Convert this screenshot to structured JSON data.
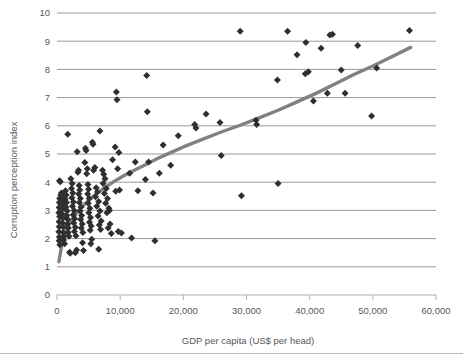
{
  "chart_data": {
    "type": "scatter",
    "title": "",
    "xlabel": "GDP per capita (US$ per head)",
    "ylabel": "Corruption perception index",
    "xlim": [
      0,
      60000
    ],
    "ylim": [
      0,
      10
    ],
    "xticks": [
      0,
      10000,
      20000,
      30000,
      40000,
      50000,
      60000
    ],
    "xtick_labels": [
      "0",
      "10,000",
      "20,000",
      "30,000",
      "40,000",
      "50,000",
      "60,000"
    ],
    "yticks": [
      0,
      1,
      2,
      3,
      4,
      5,
      6,
      7,
      8,
      9,
      10
    ],
    "ytick_labels": [
      "0",
      "1",
      "2",
      "3",
      "4",
      "5",
      "6",
      "7",
      "8",
      "9",
      "10"
    ],
    "grid": "horizontal",
    "legend": "none",
    "marker_shape": "diamond",
    "marker_color": "#2f2f31",
    "trendline": {
      "type": "logarithmic",
      "color": "#818183",
      "points": [
        [
          300,
          1.18
        ],
        [
          700,
          1.7
        ],
        [
          1200,
          2.12
        ],
        [
          1800,
          2.45
        ],
        [
          2500,
          2.72
        ],
        [
          3300,
          2.96
        ],
        [
          4200,
          3.18
        ],
        [
          5200,
          3.4
        ],
        [
          6300,
          3.6
        ],
        [
          7500,
          3.8
        ],
        [
          9000,
          4.02
        ],
        [
          10500,
          4.22
        ],
        [
          12000,
          4.4
        ],
        [
          14000,
          4.62
        ],
        [
          16000,
          4.85
        ],
        [
          18000,
          5.05
        ],
        [
          20000,
          5.25
        ],
        [
          23000,
          5.52
        ],
        [
          26000,
          5.78
        ],
        [
          29000,
          6.02
        ],
        [
          32000,
          6.28
        ],
        [
          35000,
          6.55
        ],
        [
          38000,
          6.85
        ],
        [
          41000,
          7.15
        ],
        [
          44000,
          7.48
        ],
        [
          47000,
          7.82
        ],
        [
          50000,
          8.12
        ],
        [
          53000,
          8.45
        ],
        [
          56000,
          8.78
        ]
      ]
    },
    "points": [
      [
        400,
        4.05
      ],
      [
        520,
        4.02
      ],
      [
        600,
        3.55
      ],
      [
        430,
        3.42
      ],
      [
        380,
        3.28
      ],
      [
        350,
        3.1
      ],
      [
        300,
        2.92
      ],
      [
        420,
        2.78
      ],
      [
        330,
        2.6
      ],
      [
        360,
        2.42
      ],
      [
        300,
        2.24
      ],
      [
        380,
        2.06
      ],
      [
        340,
        1.92
      ],
      [
        450,
        1.78
      ],
      [
        700,
        3.62
      ],
      [
        820,
        3.48
      ],
      [
        760,
        3.35
      ],
      [
        900,
        3.22
      ],
      [
        850,
        3.05
      ],
      [
        780,
        2.88
      ],
      [
        950,
        2.72
      ],
      [
        880,
        2.55
      ],
      [
        1020,
        2.4
      ],
      [
        960,
        2.22
      ],
      [
        1100,
        2.08
      ],
      [
        1050,
        1.95
      ],
      [
        1200,
        1.82
      ],
      [
        1350,
        3.7
      ],
      [
        1450,
        3.55
      ],
      [
        1300,
        3.4
      ],
      [
        1500,
        3.28
      ],
      [
        1420,
        3.12
      ],
      [
        1600,
        2.98
      ],
      [
        1550,
        2.82
      ],
      [
        1700,
        2.68
      ],
      [
        1650,
        2.52
      ],
      [
        1800,
        2.38
      ],
      [
        1750,
        2.22
      ],
      [
        1900,
        2.08
      ],
      [
        2000,
        1.52
      ],
      [
        2100,
        1.48
      ],
      [
        1700,
        5.7
      ],
      [
        2200,
        4.12
      ],
      [
        2400,
        3.95
      ],
      [
        2300,
        3.78
      ],
      [
        2500,
        3.62
      ],
      [
        2350,
        3.45
      ],
      [
        2600,
        3.3
      ],
      [
        2450,
        3.15
      ],
      [
        2700,
        3.0
      ],
      [
        2550,
        2.85
      ],
      [
        2800,
        2.7
      ],
      [
        2650,
        2.55
      ],
      [
        2900,
        2.4
      ],
      [
        2750,
        2.25
      ],
      [
        3000,
        2.1
      ],
      [
        3100,
        1.6
      ],
      [
        2900,
        1.5
      ],
      [
        3200,
        5.08
      ],
      [
        3300,
        4.35
      ],
      [
        3400,
        4.42
      ],
      [
        3500,
        3.88
      ],
      [
        3600,
        3.72
      ],
      [
        3450,
        3.58
      ],
      [
        3700,
        3.42
      ],
      [
        3550,
        3.28
      ],
      [
        3800,
        3.12
      ],
      [
        3650,
        2.98
      ],
      [
        3900,
        2.82
      ],
      [
        3750,
        2.68
      ],
      [
        4000,
        2.52
      ],
      [
        3850,
        2.38
      ],
      [
        4100,
        2.22
      ],
      [
        4200,
        1.58
      ],
      [
        4050,
        1.85
      ],
      [
        4400,
        4.7
      ],
      [
        4500,
        5.2
      ],
      [
        4600,
        5.12
      ],
      [
        4800,
        4.48
      ],
      [
        4700,
        4.3
      ],
      [
        4900,
        3.92
      ],
      [
        5000,
        3.75
      ],
      [
        4850,
        3.58
      ],
      [
        5100,
        3.42
      ],
      [
        4950,
        3.25
      ],
      [
        5200,
        3.08
      ],
      [
        5050,
        2.92
      ],
      [
        5300,
        2.75
      ],
      [
        5150,
        2.58
      ],
      [
        5400,
        2.45
      ],
      [
        5250,
        2.3
      ],
      [
        5500,
        1.98
      ],
      [
        5350,
        1.82
      ],
      [
        5600,
        5.42
      ],
      [
        5700,
        5.35
      ],
      [
        5800,
        4.42
      ],
      [
        6000,
        4.52
      ],
      [
        6200,
        3.8
      ],
      [
        6400,
        3.65
      ],
      [
        6100,
        3.48
      ],
      [
        6600,
        3.32
      ],
      [
        6300,
        3.15
      ],
      [
        6800,
        2.98
      ],
      [
        6500,
        2.8
      ],
      [
        7000,
        2.62
      ],
      [
        6700,
        2.48
      ],
      [
        6900,
        2.32
      ],
      [
        6600,
        1.62
      ],
      [
        6800,
        5.82
      ],
      [
        7200,
        4.42
      ],
      [
        7400,
        4.28
      ],
      [
        7600,
        4.12
      ],
      [
        7300,
        3.95
      ],
      [
        7800,
        3.78
      ],
      [
        7500,
        3.6
      ],
      [
        8000,
        3.42
      ],
      [
        7700,
        3.25
      ],
      [
        8200,
        3.08
      ],
      [
        7900,
        2.92
      ],
      [
        8400,
        2.52
      ],
      [
        8100,
        2.38
      ],
      [
        8600,
        2.18
      ],
      [
        8300,
        3.0
      ],
      [
        8800,
        4.8
      ],
      [
        9400,
        7.2
      ],
      [
        9500,
        6.92
      ],
      [
        9200,
        5.25
      ],
      [
        9800,
        5.05
      ],
      [
        9600,
        4.48
      ],
      [
        9900,
        3.72
      ],
      [
        9300,
        3.68
      ],
      [
        9700,
        2.25
      ],
      [
        10200,
        2.2
      ],
      [
        11500,
        4.32
      ],
      [
        11800,
        2.02
      ],
      [
        12400,
        4.72
      ],
      [
        12800,
        3.7
      ],
      [
        14200,
        7.78
      ],
      [
        14300,
        6.5
      ],
      [
        14500,
        4.72
      ],
      [
        14000,
        4.1
      ],
      [
        15200,
        3.62
      ],
      [
        15500,
        1.92
      ],
      [
        16200,
        4.32
      ],
      [
        16800,
        5.32
      ],
      [
        18000,
        4.6
      ],
      [
        19200,
        5.65
      ],
      [
        21800,
        6.05
      ],
      [
        22000,
        5.92
      ],
      [
        23600,
        6.42
      ],
      [
        25800,
        6.12
      ],
      [
        26000,
        4.95
      ],
      [
        29000,
        9.35
      ],
      [
        29200,
        3.52
      ],
      [
        31500,
        6.2
      ],
      [
        31600,
        6.05
      ],
      [
        34900,
        7.62
      ],
      [
        35000,
        3.95
      ],
      [
        36500,
        9.35
      ],
      [
        38000,
        8.52
      ],
      [
        39400,
        8.95
      ],
      [
        39300,
        7.85
      ],
      [
        39800,
        7.92
      ],
      [
        40600,
        6.88
      ],
      [
        41800,
        8.75
      ],
      [
        43200,
        9.22
      ],
      [
        43600,
        9.25
      ],
      [
        42800,
        7.15
      ],
      [
        45000,
        7.98
      ],
      [
        45600,
        7.15
      ],
      [
        47600,
        8.85
      ],
      [
        49800,
        6.35
      ],
      [
        50600,
        8.05
      ],
      [
        55800,
        9.38
      ]
    ]
  }
}
